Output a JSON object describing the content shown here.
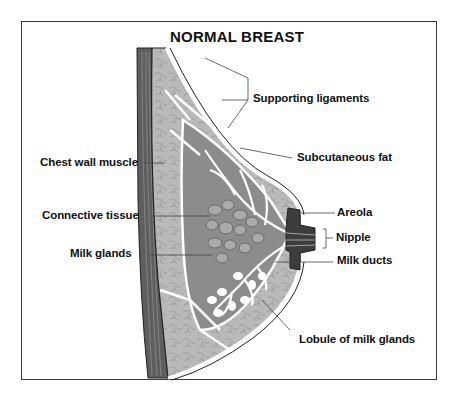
{
  "title": "NORMAL BREAST",
  "labels": {
    "supporting_ligaments": "Supporting ligaments",
    "chest_wall_muscle": "Chest wall muscle",
    "subcutaneous_fat": "Subcutaneous fat",
    "connective_tissue": "Connective tissue",
    "areola": "Areola",
    "nipple": "Nipple",
    "milk_glands": "Milk glands",
    "milk_ducts": "Milk ducts",
    "lobule_of_milk_glands": "Lobule of milk glands"
  },
  "colors": {
    "muscle": "#5f5f5f",
    "fat": "#b4b4b4",
    "gland_tissue": "#8a8a8a",
    "nipple": "#3c3c3c",
    "outline": "#222222",
    "background": "#ffffff"
  }
}
